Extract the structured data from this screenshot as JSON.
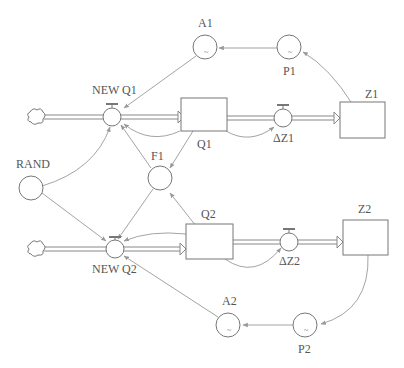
{
  "diagram": {
    "type": "stock-and-flow",
    "stocks": [
      {
        "id": "Q1",
        "label": "Q1"
      },
      {
        "id": "Q2",
        "label": "Q2"
      },
      {
        "id": "Z1",
        "label": "Z1"
      },
      {
        "id": "Z2",
        "label": "Z2"
      }
    ],
    "flows": [
      {
        "id": "NEWQ1",
        "label": "NEW Q1"
      },
      {
        "id": "NEWQ2",
        "label": "NEW Q2"
      },
      {
        "id": "dZ1",
        "label": "ΔZ1"
      },
      {
        "id": "dZ2",
        "label": "ΔZ2"
      }
    ],
    "converters": [
      {
        "id": "A1",
        "label": "A1",
        "mark": "~"
      },
      {
        "id": "P1",
        "label": "P1",
        "mark": "~"
      },
      {
        "id": "A2",
        "label": "A2",
        "mark": "~"
      },
      {
        "id": "P2",
        "label": "P2",
        "mark": "~"
      },
      {
        "id": "F1",
        "label": "F1"
      },
      {
        "id": "RAND",
        "label": "RAND"
      }
    ]
  }
}
